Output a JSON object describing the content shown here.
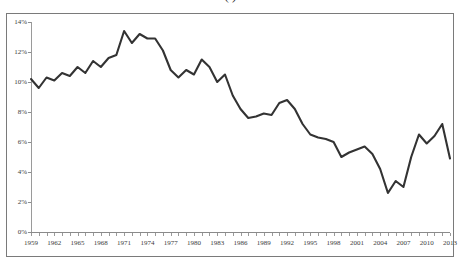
{
  "chart_data": {
    "type": "line",
    "title": "(   )",
    "xlabel": "",
    "ylabel": "",
    "xlim": [
      1959,
      2013
    ],
    "ylim": [
      0,
      14
    ],
    "ytick_labels": [
      "14%",
      "12%",
      "10%",
      "8%",
      "6%",
      "4%",
      "2%",
      "0%"
    ],
    "ytick_values": [
      14,
      12,
      10,
      8,
      6,
      4,
      2,
      0
    ],
    "xtick_labels": [
      "1959",
      "1962",
      "1965",
      "1968",
      "1971",
      "1974",
      "1977",
      "1980",
      "1983",
      "1986",
      "1989",
      "1992",
      "1995",
      "1998",
      "2001",
      "2004",
      "2007",
      "2010",
      "2013"
    ],
    "xtick_values": [
      1959,
      1962,
      1965,
      1968,
      1971,
      1974,
      1977,
      1980,
      1983,
      1986,
      1989,
      1992,
      1995,
      1998,
      2001,
      2004,
      2007,
      2010,
      2013
    ],
    "grid": false,
    "legend": "none",
    "line_color": "#333333",
    "series": [
      {
        "name": "Rate",
        "x": [
          1959,
          1960,
          1961,
          1962,
          1963,
          1964,
          1965,
          1966,
          1967,
          1968,
          1969,
          1970,
          1971,
          1972,
          1973,
          1974,
          1975,
          1976,
          1977,
          1978,
          1979,
          1980,
          1981,
          1982,
          1983,
          1984,
          1985,
          1986,
          1987,
          1988,
          1989,
          1990,
          1991,
          1992,
          1993,
          1994,
          1995,
          1996,
          1997,
          1998,
          1999,
          2000,
          2001,
          2002,
          2003,
          2004,
          2005,
          2006,
          2007,
          2008,
          2009,
          2010,
          2011,
          2012,
          2013
        ],
        "values": [
          10.2,
          9.6,
          10.3,
          10.1,
          10.6,
          10.4,
          11.0,
          10.6,
          11.4,
          11.0,
          11.6,
          11.8,
          13.4,
          12.6,
          13.2,
          12.9,
          12.9,
          12.1,
          10.8,
          10.3,
          10.8,
          10.5,
          11.5,
          11.0,
          10.0,
          10.5,
          9.1,
          8.2,
          7.6,
          7.7,
          7.9,
          7.8,
          8.6,
          8.8,
          8.2,
          7.2,
          6.5,
          6.3,
          6.2,
          6.0,
          5.0,
          5.3,
          5.5,
          5.7,
          5.2,
          4.2,
          2.6,
          3.4,
          3.0,
          5.0,
          6.5,
          5.9,
          6.4,
          7.2,
          4.9
        ]
      }
    ]
  },
  "figure": {
    "background_color": "#ffffff",
    "border_color": "#7a7a7a"
  }
}
